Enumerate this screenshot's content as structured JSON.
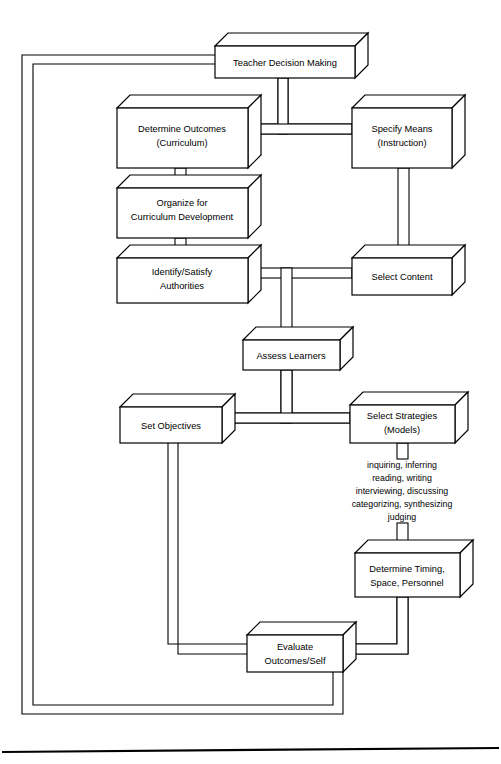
{
  "diagram": {
    "nodes": [
      {
        "id": "teacher-decision-making",
        "lines": [
          "Teacher Decision Making"
        ]
      },
      {
        "id": "determine-outcomes",
        "lines": [
          "Determine Outcomes",
          "(Curriculum)"
        ]
      },
      {
        "id": "specify-means",
        "lines": [
          "Specify Means",
          "(Instruction)"
        ]
      },
      {
        "id": "organize-for-curriculum-development",
        "lines": [
          "Organize for",
          "Curriculum Development"
        ]
      },
      {
        "id": "identify-satisfy-authorities",
        "lines": [
          "Identify/Satisfy",
          "Authorities"
        ]
      },
      {
        "id": "select-content",
        "lines": [
          "Select Content"
        ]
      },
      {
        "id": "assess-learners",
        "lines": [
          "Assess Learners"
        ]
      },
      {
        "id": "set-objectives",
        "lines": [
          "Set Objectives"
        ]
      },
      {
        "id": "select-strategies",
        "lines": [
          "Select Strategies",
          "(Models)"
        ]
      },
      {
        "id": "determine-timing",
        "lines": [
          "Determine Timing,",
          "Space, Personnel"
        ]
      },
      {
        "id": "evaluate-outcomes-self",
        "lines": [
          "Evaluate",
          "Outcomes/Self"
        ]
      }
    ],
    "strategy_list": [
      "inquiring, inferring",
      "reading, writing",
      "interviewing, discussing",
      "categorizing, synthesizing",
      "judging"
    ],
    "colors": {
      "line": "#000000",
      "fill": "#ffffff",
      "background": "#ffffff"
    }
  }
}
